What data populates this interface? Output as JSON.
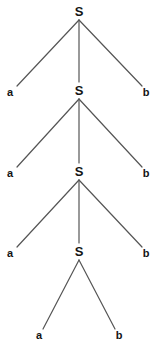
{
  "figure": {
    "width": 157,
    "height": 346,
    "background_color": "#ffffff",
    "edge_color": "#555555",
    "text_color": "#141414"
  },
  "nodes": [
    {
      "id": "s1",
      "label": "S",
      "kind": "nonterminal",
      "level": 1,
      "x": 79,
      "y": 11
    },
    {
      "id": "a1",
      "label": "a",
      "kind": "terminal",
      "level": 2,
      "x": 10,
      "y": 92
    },
    {
      "id": "s2",
      "label": "S",
      "kind": "nonterminal",
      "level": 2,
      "x": 79,
      "y": 90
    },
    {
      "id": "b1",
      "label": "b",
      "kind": "terminal",
      "level": 2,
      "x": 146,
      "y": 92
    },
    {
      "id": "a2",
      "label": "a",
      "kind": "terminal",
      "level": 3,
      "x": 10,
      "y": 173
    },
    {
      "id": "s3",
      "label": "S",
      "kind": "nonterminal",
      "level": 3,
      "x": 79,
      "y": 171
    },
    {
      "id": "b2",
      "label": "b",
      "kind": "terminal",
      "level": 3,
      "x": 146,
      "y": 173
    },
    {
      "id": "a3",
      "label": "a",
      "kind": "terminal",
      "level": 4,
      "x": 10,
      "y": 253
    },
    {
      "id": "s4",
      "label": "S",
      "kind": "nonterminal",
      "level": 4,
      "x": 79,
      "y": 251
    },
    {
      "id": "b3",
      "label": "b",
      "kind": "terminal",
      "level": 4,
      "x": 146,
      "y": 253
    },
    {
      "id": "a4",
      "label": "a",
      "kind": "terminal",
      "level": 5,
      "x": 39,
      "y": 335
    },
    {
      "id": "b4",
      "label": "b",
      "kind": "terminal",
      "level": 5,
      "x": 119,
      "y": 335
    }
  ],
  "edges": [
    {
      "from": "s1",
      "to": "a1",
      "x1": 79,
      "y1": 20,
      "x2": 17,
      "y2": 86
    },
    {
      "from": "s1",
      "to": "s2",
      "x1": 79,
      "y1": 20,
      "x2": 79,
      "y2": 82
    },
    {
      "from": "s1",
      "to": "b1",
      "x1": 79,
      "y1": 20,
      "x2": 142,
      "y2": 86
    },
    {
      "from": "s2",
      "to": "a2",
      "x1": 79,
      "y1": 99,
      "x2": 17,
      "y2": 167
    },
    {
      "from": "s2",
      "to": "s3",
      "x1": 79,
      "y1": 99,
      "x2": 79,
      "y2": 163
    },
    {
      "from": "s2",
      "to": "b2",
      "x1": 79,
      "y1": 99,
      "x2": 142,
      "y2": 167
    },
    {
      "from": "s3",
      "to": "a3",
      "x1": 79,
      "y1": 180,
      "x2": 17,
      "y2": 247
    },
    {
      "from": "s3",
      "to": "s4",
      "x1": 79,
      "y1": 180,
      "x2": 79,
      "y2": 243
    },
    {
      "from": "s3",
      "to": "b3",
      "x1": 79,
      "y1": 180,
      "x2": 142,
      "y2": 247
    },
    {
      "from": "s4",
      "to": "a4",
      "x1": 79,
      "y1": 260,
      "x2": 43,
      "y2": 329
    },
    {
      "from": "s4",
      "to": "b4",
      "x1": 79,
      "y1": 260,
      "x2": 115,
      "y2": 329
    }
  ]
}
